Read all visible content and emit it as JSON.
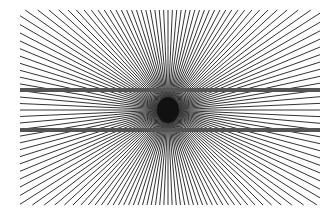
{
  "figure": {
    "background": "#ffffff",
    "center": {
      "x": 168,
      "y": 110
    },
    "rays": {
      "count": 72,
      "color": "#333333",
      "width": 1,
      "bounds": {
        "left": 20,
        "right": 320,
        "top": 10,
        "bottom": 205
      }
    },
    "center_blob": {
      "rx": 11,
      "ry": 13,
      "color": "#111111"
    },
    "bars": [
      {
        "y": 90,
        "x1": 20,
        "x2": 320,
        "thickness": 4,
        "color": "#555555"
      },
      {
        "y": 130,
        "x1": 20,
        "x2": 320,
        "thickness": 4,
        "color": "#555555"
      }
    ]
  }
}
